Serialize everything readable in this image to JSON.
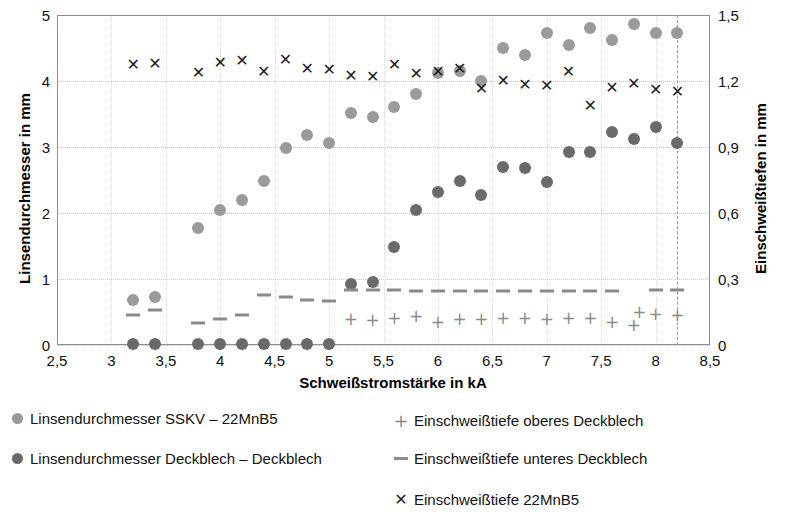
{
  "chart_data": {
    "type": "scatter",
    "title": "",
    "xlabel": "Schweißstromstärke in kA",
    "ylabel": "Linsendurchmesser in mm",
    "y2label": "Einschweißtiefen in mm",
    "xlim": [
      2.5,
      8.5
    ],
    "ylim": [
      0,
      5
    ],
    "y2lim": [
      0,
      1.5
    ],
    "xticks": [
      "2,5",
      "3",
      "3,5",
      "4",
      "4,5",
      "5",
      "5,5",
      "6",
      "6,5",
      "7",
      "7,5",
      "8",
      "8,5"
    ],
    "xtick_values": [
      2.5,
      3,
      3.5,
      4,
      4.5,
      5,
      5.5,
      6,
      6.5,
      7,
      7.5,
      8,
      8.5
    ],
    "yticks": [
      "0",
      "1",
      "2",
      "3",
      "4",
      "5"
    ],
    "ytick_values": [
      0,
      1,
      2,
      3,
      4,
      5
    ],
    "y2ticks": [
      "0",
      "0,3",
      "0,6",
      "0,9",
      "1,2",
      "1,5"
    ],
    "y2tick_values": [
      0,
      0.3,
      0.6,
      0.9,
      1.2,
      1.5
    ],
    "grid": true,
    "legend_position": "below",
    "annotations": [
      {
        "name": "spatter-limit-line",
        "type": "vline",
        "x": 8.2,
        "style": "dashed"
      }
    ],
    "series": [
      {
        "name": "Linsendurchmesser SSKV – 22MnB5",
        "marker": "circle",
        "color": "#9a9a9a",
        "axis": "left",
        "points": [
          [
            3.2,
            0.68
          ],
          [
            3.4,
            0.73
          ],
          [
            3.8,
            1.77
          ],
          [
            4.0,
            2.04
          ],
          [
            4.2,
            2.2
          ],
          [
            4.4,
            2.48
          ],
          [
            4.6,
            2.98
          ],
          [
            4.8,
            3.18
          ],
          [
            5.0,
            3.06
          ],
          [
            5.2,
            3.52
          ],
          [
            5.4,
            3.45
          ],
          [
            5.6,
            3.6
          ],
          [
            5.8,
            3.8
          ],
          [
            6.0,
            4.12
          ],
          [
            6.2,
            4.15
          ],
          [
            6.4,
            4.0
          ],
          [
            6.6,
            4.5
          ],
          [
            6.8,
            4.4
          ],
          [
            7.0,
            4.72
          ],
          [
            7.2,
            4.55
          ],
          [
            7.4,
            4.8
          ],
          [
            7.6,
            4.62
          ],
          [
            7.8,
            4.87
          ],
          [
            8.0,
            4.73
          ],
          [
            8.2,
            4.72
          ]
        ]
      },
      {
        "name": "Linsendurchmesser Deckblech – Deckblech",
        "marker": "circle",
        "color": "#6a6a6a",
        "axis": "left",
        "points": [
          [
            3.2,
            0.02
          ],
          [
            3.4,
            0.02
          ],
          [
            3.8,
            0.02
          ],
          [
            4.0,
            0.02
          ],
          [
            4.2,
            0.02
          ],
          [
            4.4,
            0.02
          ],
          [
            4.6,
            0.02
          ],
          [
            4.8,
            0.02
          ],
          [
            5.0,
            0.02
          ],
          [
            5.2,
            0.92
          ],
          [
            5.4,
            0.95
          ],
          [
            5.6,
            1.48
          ],
          [
            5.8,
            2.05
          ],
          [
            6.0,
            2.32
          ],
          [
            6.2,
            2.48
          ],
          [
            6.4,
            2.28
          ],
          [
            6.6,
            2.7
          ],
          [
            6.8,
            2.68
          ],
          [
            7.0,
            2.47
          ],
          [
            7.2,
            2.93
          ],
          [
            7.4,
            2.92
          ],
          [
            7.6,
            3.23
          ],
          [
            7.8,
            3.12
          ],
          [
            8.0,
            3.3
          ],
          [
            8.2,
            3.06
          ]
        ]
      },
      {
        "name": "Einschweißtiefe oberes Deckblech",
        "marker": "plus",
        "color": "#8a8a8a",
        "axis": "right",
        "points": [
          [
            5.2,
            0.118
          ],
          [
            5.4,
            0.112
          ],
          [
            5.6,
            0.122
          ],
          [
            5.8,
            0.133
          ],
          [
            6.0,
            0.104
          ],
          [
            6.2,
            0.12
          ],
          [
            6.4,
            0.118
          ],
          [
            6.6,
            0.124
          ],
          [
            6.8,
            0.122
          ],
          [
            7.0,
            0.117
          ],
          [
            7.2,
            0.124
          ],
          [
            7.4,
            0.122
          ],
          [
            7.6,
            0.104
          ],
          [
            7.8,
            0.092
          ],
          [
            7.85,
            0.148
          ],
          [
            8.0,
            0.14
          ],
          [
            8.2,
            0.136
          ]
        ]
      },
      {
        "name": "Einschweißtiefe unteres Deckblech",
        "marker": "dash",
        "color": "#8a8a8a",
        "axis": "right",
        "points": [
          [
            3.2,
            0.136
          ],
          [
            3.4,
            0.158
          ],
          [
            3.8,
            0.098
          ],
          [
            4.0,
            0.118
          ],
          [
            4.2,
            0.138
          ],
          [
            4.4,
            0.228
          ],
          [
            4.6,
            0.22
          ],
          [
            4.8,
            0.205
          ],
          [
            5.0,
            0.2
          ],
          [
            5.2,
            0.25
          ],
          [
            5.4,
            0.252
          ],
          [
            5.6,
            0.248
          ],
          [
            5.8,
            0.246
          ],
          [
            6.0,
            0.246
          ],
          [
            6.2,
            0.246
          ],
          [
            6.4,
            0.246
          ],
          [
            6.6,
            0.246
          ],
          [
            6.8,
            0.246
          ],
          [
            7.0,
            0.246
          ],
          [
            7.2,
            0.246
          ],
          [
            7.4,
            0.246
          ],
          [
            7.6,
            0.246
          ],
          [
            8.0,
            0.248
          ],
          [
            8.2,
            0.248
          ]
        ]
      },
      {
        "name": "Einschweißtiefe 22MnB5",
        "marker": "x",
        "color": "#1c1c1c",
        "axis": "right",
        "points": [
          [
            3.2,
            1.272
          ],
          [
            3.4,
            1.278
          ],
          [
            3.8,
            1.236
          ],
          [
            4.0,
            1.284
          ],
          [
            4.2,
            1.29
          ],
          [
            4.4,
            1.242
          ],
          [
            4.6,
            1.296
          ],
          [
            4.8,
            1.254
          ],
          [
            5.0,
            1.248
          ],
          [
            5.2,
            1.224
          ],
          [
            5.4,
            1.218
          ],
          [
            5.6,
            1.272
          ],
          [
            5.8,
            1.23
          ],
          [
            6.0,
            1.242
          ],
          [
            6.2,
            1.254
          ],
          [
            6.4,
            1.164
          ],
          [
            6.6,
            1.2
          ],
          [
            6.8,
            1.182
          ],
          [
            7.0,
            1.176
          ],
          [
            7.2,
            1.242
          ],
          [
            7.4,
            1.086
          ],
          [
            7.6,
            1.17
          ],
          [
            7.8,
            1.188
          ],
          [
            8.0,
            1.158
          ],
          [
            8.2,
            1.152
          ]
        ]
      }
    ]
  },
  "legend": {
    "items": [
      {
        "label": "Linsendurchmesser SSKV – 22MnB5",
        "marker": "circle",
        "color": "#9a9a9a"
      },
      {
        "label": "Linsendurchmesser Deckblech – Deckblech",
        "marker": "circle",
        "color": "#6a6a6a"
      },
      {
        "label": "Einschweißtiefe oberes Deckblech",
        "marker": "plus",
        "color": "#8a8a8a"
      },
      {
        "label": "Einschweißtiefe unteres Deckblech",
        "marker": "dash",
        "color": "#8a8a8a"
      },
      {
        "label": "Einschweißtiefe 22MnB5",
        "marker": "x",
        "color": "#1c1c1c"
      }
    ]
  }
}
